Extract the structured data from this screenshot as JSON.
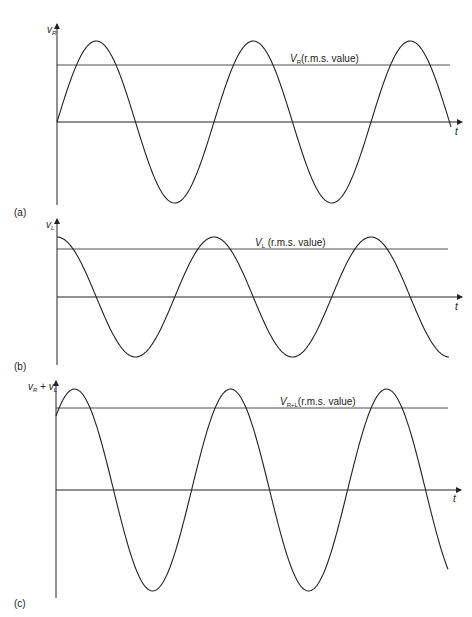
{
  "panels": [
    {
      "id": "a",
      "tag": "(a)",
      "ylabel": "v",
      "ylabel_sub": "R",
      "xlabel": "t",
      "rms_label_main": "V",
      "rms_label_sub": "R",
      "rms_label_rest": "(r.m.s. value)",
      "waveform": "sine",
      "phase": "starts at zero, rising"
    },
    {
      "id": "b",
      "tag": "(b)",
      "ylabel": "v",
      "ylabel_sub": "L",
      "xlabel": "t",
      "rms_label_main": "V",
      "rms_label_sub": "L",
      "rms_label_rest": " (r.m.s. value)",
      "waveform": "cosine",
      "phase": "starts at peak (leads by 90°)"
    },
    {
      "id": "c",
      "tag": "(c)",
      "ylabel": "v",
      "ylabel_sub": "R",
      "ylabel_plus": " + ",
      "ylabel2": "v",
      "ylabel2_sub": "L",
      "xlabel": "t",
      "rms_label_main": "V",
      "rms_label_sub": "R+L",
      "rms_label_rest": "(r.m.s. value)",
      "waveform": "sum of sine and cosine",
      "phase": "intermediate phase"
    }
  ],
  "colors": {
    "line": "#222222",
    "background": "#ffffff"
  }
}
